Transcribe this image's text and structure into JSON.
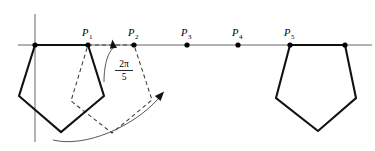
{
  "figure": {
    "colors": {
      "stroke_solid": "#111111",
      "stroke_dashed": "#3a3a3a",
      "axis": "#555555",
      "background": "#ffffff"
    },
    "axis": {
      "horizontal": {
        "x1": 18,
        "y": 45,
        "x2": 372
      },
      "vertical": {
        "x": 35,
        "y1": 14,
        "y2": 142
      }
    },
    "angle_label": {
      "numerator": "2π",
      "denominator": "5",
      "full": "2π/5",
      "x": 124,
      "y": 70
    },
    "points": [
      {
        "id": "P1",
        "label": "P",
        "subscript": "1",
        "x": 88,
        "y": 45,
        "label_x": 82,
        "label_y": 36
      },
      {
        "id": "P2",
        "label": "P",
        "subscript": "2",
        "x": 134,
        "y": 45,
        "label_x": 128,
        "label_y": 36
      },
      {
        "id": "P3",
        "label": "P",
        "subscript": "3",
        "x": 187,
        "y": 45,
        "label_x": 181,
        "label_y": 36
      },
      {
        "id": "P4",
        "label": "P",
        "subscript": "4",
        "x": 238,
        "y": 45,
        "label_x": 232,
        "label_y": 36
      },
      {
        "id": "P5",
        "label": "P",
        "subscript": "5",
        "x": 290,
        "y": 45,
        "label_x": 284,
        "label_y": 36
      }
    ],
    "extra_vertices": [
      {
        "id": "origin-vertex",
        "x": 35,
        "y": 45
      },
      {
        "id": "right-pentagon-top-right",
        "x": 345,
        "y": 45
      }
    ],
    "pentagon_left": {
      "name": "pentagon-start",
      "style": "solid",
      "points": "35,45 88,45 104,96 61,132 19,96"
    },
    "pentagon_dashed": {
      "name": "pentagon-rotated",
      "style": "dashed",
      "points": "88,45 134,45 152,100 112,133 71,101"
    },
    "pentagon_right": {
      "name": "pentagon-end",
      "style": "solid",
      "points": "290,45 345,45 356,98 318,131 276,98"
    },
    "arcs": [
      {
        "id": "arc-upper",
        "path": "M 104,82 C 104,62 109,52 113,48",
        "arrow": {
          "x": 113,
          "y": 45,
          "rotate": -8
        }
      },
      {
        "id": "arc-lower",
        "path": "M 53,140 C 86,148 134,126 158,99",
        "arrow": {
          "x": 160,
          "y": 96,
          "rotate": 42
        }
      }
    ]
  }
}
